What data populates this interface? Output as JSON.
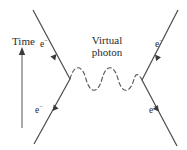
{
  "figure": {
    "kind": "feynman-diagram",
    "background_color": "#ffffff",
    "ink_color": "#404040",
    "text_color": "#2b2b2b",
    "width": 187,
    "height": 150
  },
  "axis": {
    "time_label": "Time",
    "arrow_direction": "up",
    "arrow_x": 22,
    "arrow_top_y": 48,
    "arrow_bottom_y": 128
  },
  "mediator": {
    "label_line1": "Virtual",
    "label_line2": "photon",
    "style": "dashed-wave",
    "arches": 3,
    "from_vertex": "left-vertex",
    "to_vertex": "right-vertex"
  },
  "vertices": [
    {
      "name": "left-vertex",
      "x": 70,
      "y": 79
    },
    {
      "name": "right-vertex",
      "x": 142,
      "y": 80
    }
  ],
  "particles": [
    {
      "id": "in-left",
      "symbol": "e",
      "charge": "−",
      "role": "incoming",
      "label_position": "upper-left",
      "line": {
        "x1": 33,
        "y1": 10,
        "x2": 70,
        "y2": 79
      },
      "arrow_at": 0.55,
      "arrow_direction": "down-right"
    },
    {
      "id": "in-right",
      "symbol": "e",
      "charge": "−",
      "role": "incoming",
      "label_position": "upper-right",
      "line": {
        "x1": 178,
        "y1": 10,
        "x2": 142,
        "y2": 80
      },
      "arrow_at": 0.55,
      "arrow_direction": "down-left"
    },
    {
      "id": "out-left",
      "symbol": "e",
      "charge": "−",
      "role": "outgoing",
      "label_position": "lower-left",
      "line": {
        "x1": 70,
        "y1": 79,
        "x2": 34,
        "y2": 144
      },
      "arrow_at": 0.45,
      "arrow_direction": "down-left"
    },
    {
      "id": "out-right",
      "symbol": "e",
      "charge": "−",
      "role": "outgoing",
      "label_position": "lower-right",
      "line": {
        "x1": 142,
        "y1": 80,
        "x2": 177,
        "y2": 146
      },
      "arrow_at": 0.45,
      "arrow_direction": "down-right"
    }
  ]
}
